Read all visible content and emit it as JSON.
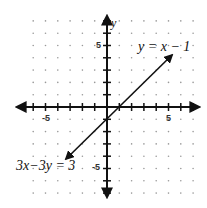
{
  "chart_data": {
    "type": "line",
    "title": "",
    "xlabel": "",
    "ylabel": "y",
    "xlim": [
      -7,
      7
    ],
    "ylim": [
      -7,
      7
    ],
    "grid": "dots",
    "tick_labels": {
      "x": [
        "-5",
        "5"
      ],
      "y": [
        "5",
        "-5"
      ]
    },
    "series": [
      {
        "name": "y = x − 1",
        "alt_name": "3x − 3y = 3",
        "equation": "y = x - 1",
        "slope": 1,
        "intercept": -1,
        "x": [
          -3.3,
          5.3
        ],
        "y": [
          -4.3,
          4.3
        ],
        "arrows": "both"
      }
    ],
    "annotations": [
      {
        "text": "y = x − 1",
        "x": 5.5,
        "y": 5.3
      },
      {
        "text": "3x − 3y = 3",
        "x": -5.8,
        "y": -5.3
      }
    ]
  },
  "labels": {
    "y_axis": "y",
    "tick_x_neg": "-5",
    "tick_x_pos": "5",
    "tick_y_pos": "5",
    "tick_y_neg": "-5",
    "eq_top": "y = x − 1",
    "eq_bottom": "3x−3y = 3"
  },
  "colors": {
    "axis": "#111111",
    "dots": "#999999",
    "line": "#111111"
  }
}
